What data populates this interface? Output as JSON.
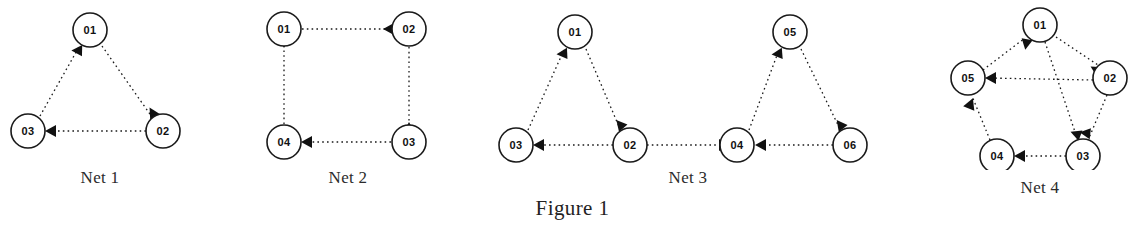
{
  "figure": {
    "caption": "Figure 1",
    "nets": [
      {
        "id": "net-1",
        "caption": "Net 1",
        "layout": "triangle",
        "nodes": [
          {
            "id": "n1",
            "label": "01",
            "x": 90,
            "y": 30
          },
          {
            "id": "n2",
            "label": "02",
            "x": 163,
            "y": 131
          },
          {
            "id": "n3",
            "label": "03",
            "x": 28,
            "y": 131
          }
        ],
        "edges": [
          {
            "from": "n3",
            "to": "n1",
            "style": "dotted",
            "arrow": "head"
          },
          {
            "from": "n1",
            "to": "n2",
            "style": "dotted",
            "arrow": "head"
          },
          {
            "from": "n2",
            "to": "n3",
            "style": "dotted",
            "arrow": "head"
          }
        ]
      },
      {
        "id": "net-2",
        "caption": "Net 2",
        "layout": "square",
        "nodes": [
          {
            "id": "n1",
            "label": "01",
            "x": 46,
            "y": 29
          },
          {
            "id": "n2",
            "label": "02",
            "x": 171,
            "y": 29
          },
          {
            "id": "n3",
            "label": "03",
            "x": 171,
            "y": 142
          },
          {
            "id": "n4",
            "label": "04",
            "x": 46,
            "y": 142
          }
        ],
        "edges": [
          {
            "from": "n1",
            "to": "n2",
            "style": "dotted",
            "arrow": "head"
          },
          {
            "from": "n2",
            "to": "n3",
            "style": "dotted",
            "arrow": "head"
          },
          {
            "from": "n3",
            "to": "n4",
            "style": "dotted",
            "arrow": "head"
          },
          {
            "from": "n4",
            "to": "n1",
            "style": "dotted",
            "arrow": "head"
          }
        ]
      },
      {
        "id": "net-3",
        "caption": "Net 3",
        "layout": "two-triangles",
        "nodes": [
          {
            "id": "n1",
            "label": "01",
            "x": 97,
            "y": 32
          },
          {
            "id": "n2",
            "label": "02",
            "x": 152,
            "y": 145
          },
          {
            "id": "n3",
            "label": "03",
            "x": 38,
            "y": 145
          },
          {
            "id": "n4",
            "label": "04",
            "x": 259,
            "y": 145
          },
          {
            "id": "n5",
            "label": "05",
            "x": 312,
            "y": 32
          },
          {
            "id": "n6",
            "label": "06",
            "x": 372,
            "y": 145
          }
        ],
        "edges": [
          {
            "from": "n3",
            "to": "n1",
            "style": "dotted",
            "arrow": "head"
          },
          {
            "from": "n1",
            "to": "n2",
            "style": "dotted",
            "arrow": "head"
          },
          {
            "from": "n2",
            "to": "n3",
            "style": "dotted",
            "arrow": "head"
          },
          {
            "from": "n4",
            "to": "n5",
            "style": "dotted",
            "arrow": "head"
          },
          {
            "from": "n5",
            "to": "n6",
            "style": "dotted",
            "arrow": "head"
          },
          {
            "from": "n6",
            "to": "n4",
            "style": "dotted",
            "arrow": "head"
          }
        ]
      },
      {
        "id": "net-4",
        "caption": "Net 4",
        "layout": "pentagon",
        "nodes": [
          {
            "id": "n1",
            "label": "01",
            "x": 105,
            "y": 25
          },
          {
            "id": "n2",
            "label": "02",
            "x": 175,
            "y": 78
          },
          {
            "id": "n3",
            "label": "03",
            "x": 148,
            "y": 156
          },
          {
            "id": "n4",
            "label": "04",
            "x": 62,
            "y": 156
          },
          {
            "id": "n5",
            "label": "05",
            "x": 33,
            "y": 78
          }
        ],
        "edges": [
          {
            "from": "n5",
            "to": "n1",
            "style": "dotted",
            "arrow": "head"
          },
          {
            "from": "n1",
            "to": "n2",
            "style": "dotted",
            "arrow": "head"
          },
          {
            "from": "n2",
            "to": "n3",
            "style": "dotted",
            "arrow": "head"
          },
          {
            "from": "n3",
            "to": "n4",
            "style": "dotted",
            "arrow": "head"
          },
          {
            "from": "n4",
            "to": "n5",
            "style": "dotted",
            "arrow": "head"
          },
          {
            "from": "n2",
            "to": "n5",
            "style": "dotted",
            "arrow": "head"
          },
          {
            "from": "n1",
            "to": "n3",
            "style": "dotted",
            "arrow": "head"
          }
        ]
      }
    ]
  },
  "style": {
    "ink": "#1a1a1a",
    "paper": "#ffffff",
    "node_radius": 17,
    "edge_dash": "1.6 3.2"
  }
}
